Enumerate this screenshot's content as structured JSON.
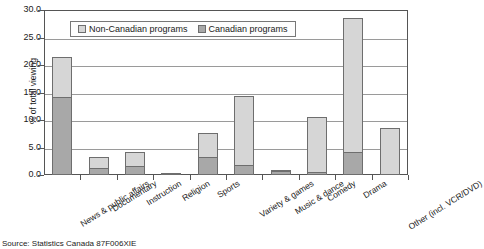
{
  "chart_data": {
    "type": "bar",
    "subtype": "stacked-vertical",
    "title": "",
    "xlabel": "",
    "ylabel": "% of total viewing",
    "ylim": [
      0.0,
      30.0
    ],
    "ytick_step": 5.0,
    "ytick_labels": [
      "30.0",
      "25.0",
      "20.0",
      "15.0",
      "10.0",
      "5.0",
      "0.0"
    ],
    "ytick_values": [
      30.0,
      25.0,
      20.0,
      15.0,
      10.0,
      5.0,
      0.0
    ],
    "grid": true,
    "grid_axis": "y",
    "legend_position": "top-center-inside",
    "categories": [
      "News & public affairs",
      "Documentary",
      "Instruction",
      "Religion",
      "Sports",
      "Variety & games",
      "Music & dance",
      "Comedy",
      "Drama",
      "Other (incl. VCR/DVD)"
    ],
    "series": [
      {
        "name": "Canadian programs",
        "color": "#a8a8a8",
        "values": [
          14.2,
          1.2,
          1.7,
          0.4,
          3.2,
          1.9,
          0.7,
          0.5,
          4.2,
          0.0
        ]
      },
      {
        "name": "Non-Canadian programs",
        "color": "#d6d6d6",
        "values": [
          7.3,
          2.1,
          2.5,
          0.0,
          4.4,
          12.5,
          0.1,
          10.1,
          24.3,
          8.5
        ]
      }
    ],
    "totals": [
      21.5,
      3.3,
      4.2,
      0.4,
      7.6,
      14.4,
      0.8,
      10.6,
      28.5,
      8.5
    ]
  },
  "legend": {
    "entries": [
      {
        "label": "Non-Canadian programs",
        "color": "#d6d6d6"
      },
      {
        "label": "Canadian programs",
        "color": "#a8a8a8"
      }
    ]
  },
  "source": {
    "text": "Source: Statistics Canada 87F006XIE"
  }
}
